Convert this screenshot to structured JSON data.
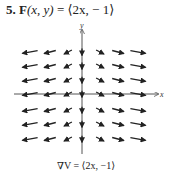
{
  "problem": {
    "number": "5.",
    "function_name": "F",
    "arguments": "(x,  y)",
    "equals": "=",
    "expression": "⟨2x,   − 1⟩"
  },
  "plot": {
    "x_axis_label": "x",
    "y_axis_label": "y",
    "axis_color": "#555555",
    "arrow_color": "#222222",
    "field_formula": "F(x, y) = ⟨2x, −1⟩",
    "columns_x": [
      -3,
      -2,
      -1,
      0,
      1,
      2,
      3
    ],
    "rows_y": [
      3,
      2,
      1,
      0,
      -1,
      -2,
      -3
    ]
  },
  "caption": {
    "text": "∇V = ⟨2x, −1⟩"
  }
}
